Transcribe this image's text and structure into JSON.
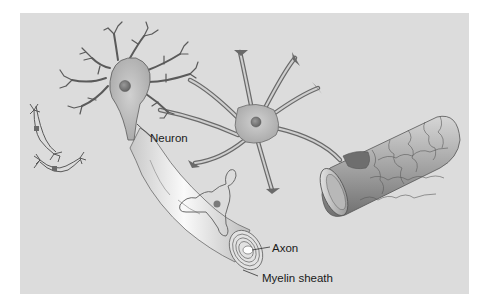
{
  "figure": {
    "labels": {
      "neuron": "Neuron",
      "axon": "Axon",
      "myelin_sheath": "Myelin sheath"
    },
    "colors": {
      "background": "#dcdcdc",
      "cell_body": "#b9b9b9",
      "outline": "#5a5a5a",
      "nucleus": "#7a7a7a",
      "myelin": "#f2f2f2",
      "vessel": "#9a9a9a"
    }
  }
}
